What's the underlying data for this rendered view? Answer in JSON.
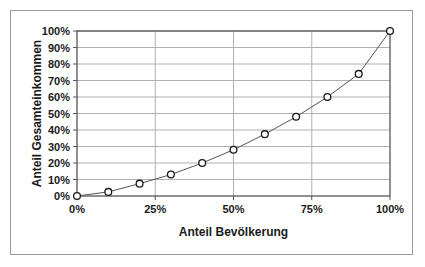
{
  "chart_data": {
    "type": "line",
    "title": "",
    "xlabel": "Anteil Bevölkerung",
    "ylabel": "Anteil Gesamteinkommen",
    "xlim": [
      0,
      100
    ],
    "ylim": [
      0,
      100
    ],
    "grid": true,
    "legend": "none",
    "x_tick_labels": [
      "0%",
      "25%",
      "50%",
      "75%",
      "100%"
    ],
    "x_tick_values": [
      0,
      25,
      50,
      75,
      100
    ],
    "y_tick_labels": [
      "0%",
      "10%",
      "20%",
      "30%",
      "40%",
      "50%",
      "60%",
      "70%",
      "80%",
      "90%",
      "100%"
    ],
    "y_tick_values": [
      0,
      10,
      20,
      30,
      40,
      50,
      60,
      70,
      80,
      90,
      100
    ],
    "series": [
      {
        "name": "Lorenzkurve",
        "marker": "open-circle",
        "x": [
          0,
          10,
          20,
          30,
          40,
          50,
          60,
          70,
          80,
          90,
          100
        ],
        "values": [
          0,
          2.5,
          7.5,
          13,
          20,
          28,
          37.5,
          48,
          60,
          74,
          100
        ]
      }
    ],
    "colors": {
      "line": "#555555",
      "marker_stroke": "#1a1a1a",
      "marker_fill": "#ffffff",
      "grid": "#b0b0b0",
      "axis": "#555555",
      "frame": "#9a9a9a",
      "background": "#ffffff",
      "text": "#1a1a1a"
    }
  }
}
